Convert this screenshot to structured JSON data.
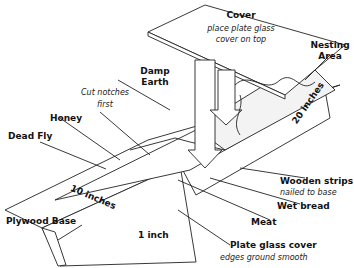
{
  "diagram": {
    "labels": {
      "cover": "Cover",
      "cover_note_1": "place plate glass",
      "cover_note_2": "cover on top",
      "nesting_1": "Nesting",
      "nesting_2": "Area",
      "damp_1": "Damp",
      "damp_2": "Earth",
      "notches_1": "Cut notches",
      "notches_2": "first",
      "honey": "Honey",
      "dead_fly": "Dead Fly",
      "dim_20": "20 inches",
      "dim_10": "10 inches",
      "dim_1": "1 inch",
      "wooden_strips": "Wooden strips",
      "wooden_strips_note": "nailed to base",
      "wet_bread": "Wet bread",
      "meat": "Meat",
      "plate_glass": "Plate glass cover",
      "plate_glass_note": "edges ground smooth",
      "plywood_base": "Plywood Base"
    }
  }
}
